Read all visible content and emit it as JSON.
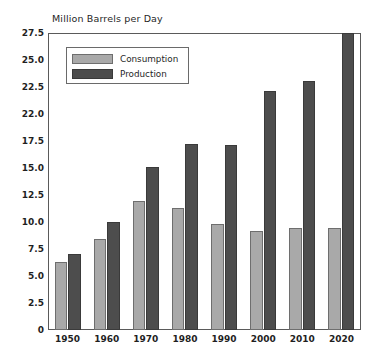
{
  "chart_data": {
    "type": "bar",
    "title": "Million Barrels per Day",
    "xlabel": "",
    "ylabel": "Million Barrels per Day",
    "categories": [
      "1950",
      "1960",
      "1970",
      "1980",
      "1990",
      "2000",
      "2010",
      "2020"
    ],
    "series": [
      {
        "name": "Consumption",
        "color": "#a9a9a9",
        "values": [
          6.3,
          8.4,
          11.9,
          11.3,
          9.8,
          9.2,
          9.4,
          9.4
        ]
      },
      {
        "name": "Production",
        "color": "#4d4d4d",
        "values": [
          7.0,
          10.0,
          15.1,
          17.2,
          17.1,
          22.1,
          23.1,
          27.5
        ]
      }
    ],
    "ylim": [
      0,
      27.5
    ],
    "ytick_labels": [
      "27.5",
      "25.0",
      "22.5",
      "22.0",
      "17.5",
      "15.0",
      "12.5",
      "10.0",
      "7.5",
      "5.0",
      "2.5",
      "0"
    ],
    "ytick_values": [
      27.5,
      25.0,
      22.5,
      20.0,
      17.5,
      15.0,
      12.5,
      10.0,
      7.5,
      5.0,
      2.5,
      0
    ],
    "grid": false,
    "legend_position": "top-left",
    "legend_entries": [
      "Consumption",
      "Production"
    ]
  }
}
